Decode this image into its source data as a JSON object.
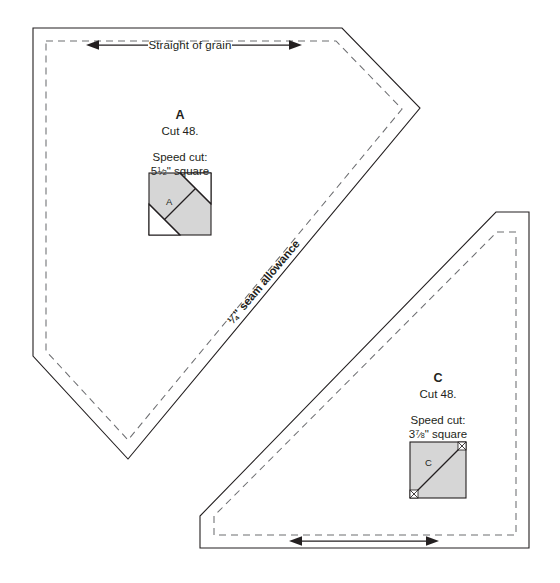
{
  "sheet": {
    "width": 560,
    "height": 583,
    "background": "#ffffff",
    "line_color": "#231f20",
    "dashed_color": "#6d6e71",
    "shade_color": "#d6d6d6",
    "title_note": "Quilting pattern template sheet"
  },
  "grain_label": "Straight of grain",
  "seam_allowance_label": "¼\" seam allowance",
  "pieces": [
    {
      "id": "A",
      "letter": "A",
      "cut_label": "Cut 48.",
      "cut_count": 48,
      "speed_cut_heading": "Speed cut:",
      "speed_cut_size_whole": "5",
      "speed_cut_size_num": "1",
      "speed_cut_size_den": "2",
      "speed_cut_size_unit": "\" square",
      "speed_cut_size_text": "5½\" square",
      "square_label": "A",
      "square_diagram": "shaded-square-with-diagonal-and-trimmed-corners",
      "shape": "pentagon"
    },
    {
      "id": "C",
      "letter": "C",
      "cut_label": "Cut 48.",
      "cut_count": 48,
      "speed_cut_heading": "Speed cut:",
      "speed_cut_size_whole": "3",
      "speed_cut_size_num": "7",
      "speed_cut_size_den": "8",
      "speed_cut_size_unit": "\" square",
      "speed_cut_size_text": "3⅞\" square",
      "square_label": "C",
      "square_diagram": "shaded-square-with-diagonal",
      "shape": "right-triangle"
    }
  ]
}
